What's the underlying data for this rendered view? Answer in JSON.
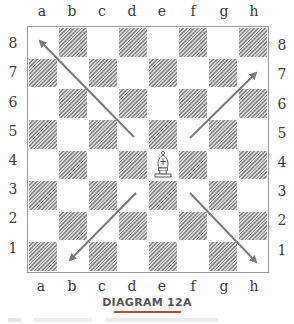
{
  "diagram": {
    "caption": "DIAGRAM 12A",
    "files": [
      "a",
      "b",
      "c",
      "d",
      "e",
      "f",
      "g",
      "h"
    ],
    "ranks": [
      "8",
      "7",
      "6",
      "5",
      "4",
      "3",
      "2",
      "1"
    ],
    "piece": {
      "type": "bishop",
      "color": "white",
      "square": "e4",
      "glyph": "♗"
    },
    "arrows": [
      {
        "from": "e4",
        "to": "a8",
        "direction": "up-left"
      },
      {
        "from": "e4",
        "to": "h7",
        "direction": "up-right"
      },
      {
        "from": "e4",
        "to": "b1",
        "direction": "down-left"
      },
      {
        "from": "e4",
        "to": "h1",
        "direction": "down-right"
      }
    ],
    "colors": {
      "arrow": "#7a7a7a",
      "dark_square_hatch": "#8a8a8a",
      "caption_underline": "#b04a3a"
    }
  }
}
